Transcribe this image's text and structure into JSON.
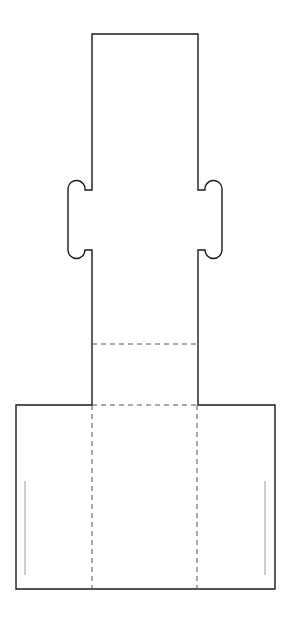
{
  "diagram": {
    "type": "packaging-dieline",
    "colors": {
      "background": "#ffffff",
      "cut_line": "#1a1a1a",
      "fold_line": "#555555",
      "inner_guide": "#999999"
    },
    "outline": {
      "path": "M92,34 L198,34 L198,190 L205,190 A8.5,8.5 0 0 1 222,188 L222,250 A8.5,8.5 0 0 1 205,250 L198,250 L198,405 L275,405 L275,589 L16,589 L16,405 L92,405 L92,250 L85,250 A8.5,8.5 0 0 1 68,250 L68,188 A8.5,8.5 0 0 1 85,190 L92,190 Z"
    },
    "fold_lines": [
      {
        "name": "fold-upper-horizontal",
        "x1": 92,
        "y1": 344,
        "x2": 198,
        "y2": 344
      },
      {
        "name": "fold-lower-horizontal",
        "x1": 92,
        "y1": 405,
        "x2": 198,
        "y2": 405
      },
      {
        "name": "fold-left-vertical",
        "x1": 92,
        "y1": 405,
        "x2": 92,
        "y2": 589
      },
      {
        "name": "fold-right-vertical",
        "x1": 197,
        "y1": 405,
        "x2": 197,
        "y2": 589
      }
    ],
    "inner_guides": [
      {
        "name": "guide-left",
        "x1": 25,
        "y1": 481,
        "x2": 25,
        "y2": 575
      },
      {
        "name": "guide-right",
        "x1": 265,
        "y1": 481,
        "x2": 265,
        "y2": 575
      }
    ]
  }
}
